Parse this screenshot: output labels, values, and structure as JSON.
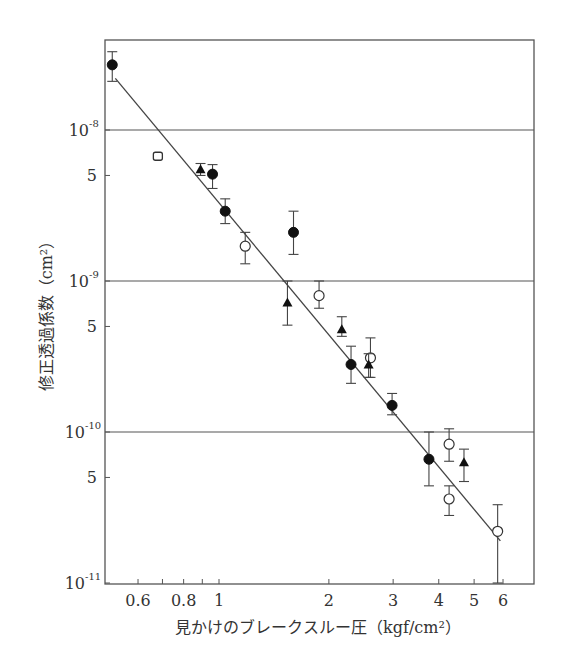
{
  "chart_data": {
    "type": "scatter",
    "title": "",
    "xlabel": "見かけのブレークスルー圧（kgf/cm²）",
    "ylabel": "修正透過係数（cm²）",
    "xscale": "log",
    "yscale": "log",
    "xlim": [
      0.5,
      6.7
    ],
    "ylim": [
      1e-11,
      4e-08
    ],
    "x_ticks": [
      {
        "value": 0.6,
        "label": "0.6"
      },
      {
        "value": 0.7,
        "label": ""
      },
      {
        "value": 0.8,
        "label": "0.8"
      },
      {
        "value": 0.9,
        "label": ""
      },
      {
        "value": 1,
        "label": "1"
      },
      {
        "value": 2,
        "label": "2"
      },
      {
        "value": 3,
        "label": "3"
      },
      {
        "value": 4,
        "label": "4"
      },
      {
        "value": 5,
        "label": "5"
      },
      {
        "value": 6,
        "label": "6"
      }
    ],
    "y_ticks": [
      {
        "value": 1e-08,
        "label": "10",
        "sup": "-8",
        "grid": true
      },
      {
        "value": 5e-09,
        "label": "5",
        "sup": "",
        "grid": false
      },
      {
        "value": 1e-09,
        "label": "10",
        "sup": "-9",
        "grid": true
      },
      {
        "value": 5e-10,
        "label": "5",
        "sup": "",
        "grid": false
      },
      {
        "value": 1e-10,
        "label": "10",
        "sup": "-10",
        "grid": true
      },
      {
        "value": 5e-11,
        "label": "5",
        "sup": "",
        "grid": false
      },
      {
        "value": 1e-11,
        "label": "10",
        "sup": "-11",
        "grid": false
      }
    ],
    "grid": "horizontal lines at decades",
    "legend": "none",
    "series": [
      {
        "name": "filled-circle",
        "marker": "filled-circle",
        "points": [
          {
            "x": 0.51,
            "y": 2.7e-08,
            "ylo": 2.1e-08,
            "yhi": 3.3e-08
          },
          {
            "x": 0.96,
            "y": 5.1e-09,
            "ylo": 4.1e-09,
            "yhi": 5.9e-09
          },
          {
            "x": 1.04,
            "y": 2.9e-09,
            "ylo": 2.4e-09,
            "yhi": 3.5e-09
          },
          {
            "x": 1.6,
            "y": 2.1e-09,
            "ylo": 1.5e-09,
            "yhi": 2.9e-09
          },
          {
            "x": 2.3,
            "y": 2.8e-10,
            "ylo": 2.1e-10,
            "yhi": 3.7e-10
          },
          {
            "x": 2.98,
            "y": 1.5e-10,
            "ylo": 1.3e-10,
            "yhi": 1.8e-10
          },
          {
            "x": 3.76,
            "y": 6.6e-11,
            "ylo": 4.4e-11,
            "yhi": 1e-10
          }
        ]
      },
      {
        "name": "open-circle",
        "marker": "open-circle",
        "points": [
          {
            "x": 1.18,
            "y": 1.7e-09,
            "ylo": 1.3e-09,
            "yhi": 2.1e-09
          },
          {
            "x": 1.88,
            "y": 8e-10,
            "ylo": 6.6e-10,
            "yhi": 1e-09
          },
          {
            "x": 2.6,
            "y": 3.1e-10,
            "ylo": 2.3e-10,
            "yhi": 4.2e-10
          },
          {
            "x": 4.27,
            "y": 8.3e-11,
            "ylo": 6.4e-11,
            "yhi": 1.05e-10
          },
          {
            "x": 4.27,
            "y": 3.6e-11,
            "ylo": 2.8e-11,
            "yhi": 4.4e-11
          },
          {
            "x": 5.8,
            "y": 2.2e-11,
            "ylo": 1e-11,
            "yhi": 3.3e-11
          }
        ]
      },
      {
        "name": "open-square",
        "marker": "open-square",
        "points": [
          {
            "x": 0.68,
            "y": 6.7e-09,
            "ylo": 6.7e-09,
            "yhi": 6.7e-09
          }
        ]
      },
      {
        "name": "filled-triangle",
        "marker": "filled-triangle",
        "points": [
          {
            "x": 0.89,
            "y": 5.5e-09,
            "ylo": 5e-09,
            "yhi": 6e-09
          },
          {
            "x": 1.54,
            "y": 7.2e-10,
            "ylo": 5.1e-10,
            "yhi": 1e-09
          },
          {
            "x": 2.17,
            "y": 4.8e-10,
            "ylo": 4.3e-10,
            "yhi": 5.8e-10
          },
          {
            "x": 2.57,
            "y": 2.8e-10,
            "ylo": 2.3e-10,
            "yhi": 3.3e-10
          },
          {
            "x": 4.69,
            "y": 6.3e-11,
            "ylo": 4.7e-11,
            "yhi": 7.7e-11
          }
        ]
      }
    ],
    "fit_line": {
      "x": [
        0.52,
        5.9
      ],
      "y": [
        2.2e-08,
        1.9e-11
      ],
      "style": "solid"
    }
  }
}
